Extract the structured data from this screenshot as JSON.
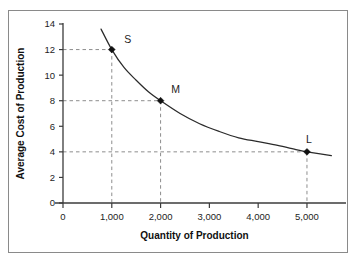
{
  "figure": {
    "border_color": "#8a8a8a",
    "background": "#ffffff"
  },
  "chart_data": {
    "type": "line",
    "title": "",
    "xlabel": "Quantity of Production",
    "ylabel": "Average Cost of Production",
    "xlim": [
      0,
      5800
    ],
    "ylim": [
      0,
      14
    ],
    "grid": false,
    "legend": null,
    "xticks": [
      0,
      1000,
      2000,
      3000,
      4000,
      5000
    ],
    "xticklabels": [
      "0",
      "1,000",
      "2,000",
      "3,000",
      "4,000",
      "5,000"
    ],
    "yticks": [
      0,
      2,
      4,
      6,
      8,
      10,
      12,
      14
    ],
    "yticklabels": [
      "0",
      "2",
      "4",
      "6",
      "8",
      "10",
      "12",
      "14"
    ],
    "series": [
      {
        "name": "Average cost curve",
        "x": [
          780,
          1000,
          1250,
          1500,
          1750,
          2000,
          2400,
          2800,
          3200,
          3600,
          4000,
          4400,
          4800,
          5000,
          5500
        ],
        "y": [
          13.6,
          12.0,
          10.6,
          9.6,
          8.7,
          8.0,
          7.0,
          6.2,
          5.6,
          5.1,
          4.8,
          4.5,
          4.15,
          4.0,
          3.7
        ],
        "color": "#2a2a2a"
      }
    ],
    "points": [
      {
        "label": "S",
        "x": 1000,
        "y": 12,
        "label_dx": 16,
        "label_dy": -7
      },
      {
        "label": "M",
        "x": 2000,
        "y": 8,
        "label_dx": 15,
        "label_dy": -8
      },
      {
        "label": "L",
        "x": 5000,
        "y": 4,
        "label_dx": 2,
        "label_dy": -9
      }
    ],
    "guides": [
      {
        "value_y": 12,
        "value_x": 1000
      },
      {
        "value_y": 8,
        "value_x": 2000
      },
      {
        "value_y": 4,
        "value_x": 5000
      }
    ],
    "marker_style": "diamond",
    "marker_color": "#111111",
    "guide_color": "#8d8d8d",
    "axis_color": "#3b3b3b"
  }
}
